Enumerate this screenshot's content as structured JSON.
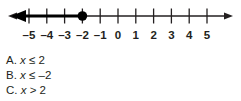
{
  "figure": {
    "type": "number-line",
    "axis": {
      "min": -5,
      "max": 5,
      "arrow_left": true,
      "arrow_right": true,
      "color": "#231f20"
    },
    "tick_labels": [
      "–5",
      "–4",
      "–3",
      "–2",
      "–1",
      "0",
      "1",
      "2",
      "3",
      "4",
      "5"
    ],
    "tick_values": [
      -5,
      -4,
      -3,
      -2,
      -1,
      0,
      1,
      2,
      3,
      4,
      5
    ],
    "point": {
      "value": -2,
      "style": "closed",
      "color": "#000000"
    },
    "ray": {
      "from": -2,
      "direction": "left",
      "arrow": true,
      "inclusive": true,
      "color": "#000000"
    },
    "represents": "x ≤ –2"
  },
  "choices": [
    {
      "letter": "A.",
      "variable": "x",
      "relation": "≤",
      "value": "2",
      "text": "A.  x ≤ 2"
    },
    {
      "letter": "B.",
      "variable": "x",
      "relation": "≤",
      "value": "–2",
      "text": "B.  x ≤ –2"
    },
    {
      "letter": "C.",
      "variable": "x",
      "relation": ">",
      "value": "2",
      "text": "C.  x > 2"
    }
  ]
}
